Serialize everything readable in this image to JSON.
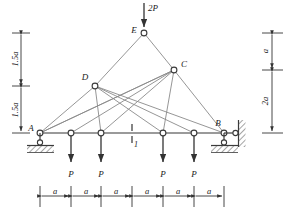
{
  "figure": {
    "type": "statics-truss-diagram",
    "line_color": "#7a7a7a",
    "chord_color": "#8c8c8c",
    "text_color": "#1a1a1a",
    "hatch_color": "#4a4a4a",
    "background": "#ffffff"
  },
  "nodes": {
    "A": {
      "label": "A",
      "x": 40,
      "y": 133
    },
    "B": {
      "label": "B",
      "x": 224,
      "y": 133
    },
    "C": {
      "label": "C",
      "x": 174,
      "y": 70
    },
    "D": {
      "label": "D",
      "x": 95,
      "y": 86
    },
    "E": {
      "label": "E",
      "x": 144,
      "y": 33
    },
    "n1": {
      "label": "",
      "x": 71,
      "y": 133
    },
    "n2": {
      "label": "",
      "x": 101,
      "y": 133
    },
    "n3": {
      "label": "",
      "x": 163,
      "y": 133
    },
    "n4": {
      "label": "",
      "x": 194,
      "y": 133
    }
  },
  "loads": {
    "top": {
      "label": "2P",
      "at_node": "E",
      "direction": "down"
    },
    "bottom": [
      {
        "label": "P",
        "x": 71
      },
      {
        "label": "P",
        "x": 101
      },
      {
        "label": "P",
        "x": 163
      },
      {
        "label": "P",
        "x": 194
      }
    ]
  },
  "section_marker": {
    "label": "1",
    "x": 132,
    "y": 133
  },
  "supports": {
    "A": {
      "kind": "pinned-hatched-ground"
    },
    "B": {
      "kind": "roller-wall-and-ground"
    }
  },
  "dimensions": {
    "left": {
      "segments": [
        {
          "label": "1.5a"
        },
        {
          "label": "1.5a"
        }
      ]
    },
    "right": {
      "segments": [
        {
          "label": "a"
        },
        {
          "label": "2a"
        }
      ]
    },
    "bottom": {
      "segments": [
        {
          "label": "a"
        },
        {
          "label": "a"
        },
        {
          "label": "a"
        },
        {
          "label": "a"
        },
        {
          "label": "a"
        },
        {
          "label": "a"
        }
      ]
    }
  }
}
